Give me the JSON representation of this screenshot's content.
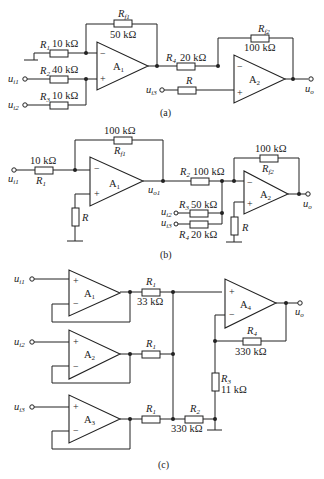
{
  "figure": {
    "a": {
      "caption": "(a)",
      "opamps": [
        {
          "name": "A1"
        },
        {
          "name": "A2"
        }
      ],
      "resistors": {
        "R1": {
          "name": "R1",
          "value": "10 kΩ"
        },
        "R2": {
          "name": "R2",
          "value": "40 kΩ"
        },
        "R3": {
          "name": "R3",
          "value": "10 kΩ"
        },
        "Rf1": {
          "name": "Rf1",
          "value": "50 kΩ"
        },
        "R4": {
          "name": "R4",
          "value": "20 kΩ"
        },
        "Rf2": {
          "name": "Rf2",
          "value": "100 kΩ"
        },
        "R": {
          "name": "R"
        }
      },
      "inputs": [
        "ui1",
        "ui2",
        "ui3"
      ],
      "output": "uo"
    },
    "b": {
      "caption": "(b)",
      "opamps": [
        {
          "name": "A1"
        },
        {
          "name": "A2"
        }
      ],
      "resistors": {
        "R1": {
          "name": "R1",
          "value": "10 kΩ"
        },
        "Rf1": {
          "name": "Rf1",
          "value": "100 kΩ"
        },
        "R2": {
          "name": "R2",
          "value": "100 kΩ"
        },
        "R3": {
          "name": "R3",
          "value": "50 kΩ"
        },
        "R4": {
          "name": "R4",
          "value": "20 kΩ"
        },
        "Rf2": {
          "name": "Rf2",
          "value": "100 kΩ"
        },
        "R": {
          "name": "R"
        }
      },
      "inputs": [
        "ui1",
        "ui2",
        "ui3"
      ],
      "intermediate": "uo1",
      "output": "uo"
    },
    "c": {
      "caption": "(c)",
      "opamps": [
        {
          "name": "A1"
        },
        {
          "name": "A2"
        },
        {
          "name": "A3"
        },
        {
          "name": "A4"
        }
      ],
      "resistors": {
        "R1": {
          "name": "R1",
          "value": "33 kΩ"
        },
        "R2": {
          "name": "R2",
          "value": "330 kΩ"
        },
        "R3": {
          "name": "R3",
          "value": "11 kΩ"
        },
        "R4": {
          "name": "R4",
          "value": "330 kΩ"
        }
      },
      "inputs": [
        "ui1",
        "ui2",
        "ui3"
      ],
      "output": "uo"
    }
  },
  "text": {
    "R": "R",
    "f1": "f1",
    "f2": "f2",
    "A": "A",
    "s1": "1",
    "s2": "2",
    "s3": "3",
    "s4": "4",
    "u": "u",
    "i1": "i1",
    "i2": "i2",
    "i3": "i3",
    "o": "o",
    "o1": "o1",
    "minus": "−",
    "plus": "+",
    "a_R1v": "10 kΩ",
    "a_R2v": "40 kΩ",
    "a_R3v": "10 kΩ",
    "a_Rf1v": "50 kΩ",
    "a_R4v": "20 kΩ",
    "a_Rf2v": "100 kΩ",
    "b_R1v": "10 kΩ",
    "b_Rf1v": "100 kΩ",
    "b_R2v": "100 kΩ",
    "b_R3v": "50 kΩ",
    "b_R4v": "20 kΩ",
    "b_Rf2v": "100 kΩ",
    "c_R1v": "33 kΩ",
    "c_R2v": "330 kΩ",
    "c_R3v": "11 kΩ",
    "c_R4v": "330 kΩ",
    "cap_a": "(a)",
    "cap_b": "(b)",
    "cap_c": "(c)"
  }
}
